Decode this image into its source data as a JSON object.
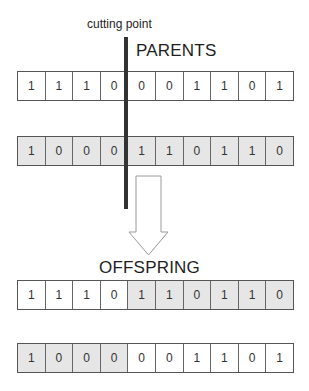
{
  "labels": {
    "cutting_point": "cutting point",
    "parents": "PARENTS",
    "offspring": "OFFSPRING"
  },
  "colors": {
    "shaded_fill": "#e6e6e6",
    "plain_fill": "#ffffff",
    "border": "#555555",
    "cut_line": "#333333"
  },
  "cut_after_index": 4,
  "parents": [
    {
      "name": "parent-1",
      "shading": [
        "plain",
        "plain",
        "plain",
        "plain",
        "plain",
        "plain",
        "plain",
        "plain",
        "plain",
        "plain"
      ],
      "genes": [
        "1",
        "1",
        "1",
        "0",
        "0",
        "0",
        "1",
        "1",
        "0",
        "1"
      ]
    },
    {
      "name": "parent-2",
      "shading": [
        "shaded",
        "shaded",
        "shaded",
        "shaded",
        "shaded",
        "shaded",
        "shaded",
        "shaded",
        "shaded",
        "shaded"
      ],
      "genes": [
        "1",
        "0",
        "0",
        "0",
        "1",
        "1",
        "0",
        "1",
        "1",
        "0"
      ]
    }
  ],
  "offspring": [
    {
      "name": "offspring-1",
      "shading": [
        "plain",
        "plain",
        "plain",
        "plain",
        "shaded",
        "shaded",
        "shaded",
        "shaded",
        "shaded",
        "shaded"
      ],
      "genes": [
        "1",
        "1",
        "1",
        "0",
        "1",
        "1",
        "0",
        "1",
        "1",
        "0"
      ]
    },
    {
      "name": "offspring-2",
      "shading": [
        "shaded",
        "shaded",
        "shaded",
        "shaded",
        "plain",
        "plain",
        "plain",
        "plain",
        "plain",
        "plain"
      ],
      "genes": [
        "1",
        "0",
        "0",
        "0",
        "0",
        "0",
        "1",
        "1",
        "0",
        "1"
      ]
    }
  ]
}
